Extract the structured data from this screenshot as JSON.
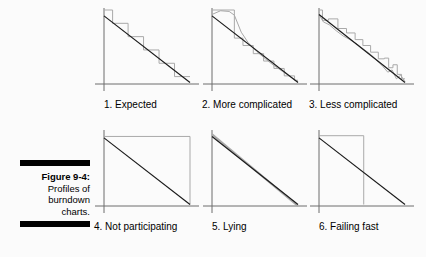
{
  "figure": {
    "caption_title": "Figure 9-4:",
    "caption_lines": [
      "Profiles of",
      "burndown",
      "charts."
    ]
  },
  "colors": {
    "background": "#fbfbfb",
    "axis": "#6d6d6d",
    "ideal_line": "#1a1a1a",
    "actual_line": "#a9a9a9",
    "caption_rule": "#000000",
    "text": "#000000"
  },
  "chart_data": [
    {
      "type": "line",
      "id": "expected",
      "index": "1.",
      "title": "1. Expected",
      "xlabel": "",
      "ylabel": "",
      "xlim": [
        0,
        10
      ],
      "ylim": [
        0,
        10
      ],
      "grid": false,
      "legend": "none",
      "series": [
        {
          "name": "ideal",
          "style": "straight-dark",
          "x": [
            0,
            10
          ],
          "values": [
            9.2,
            0.2
          ]
        },
        {
          "name": "actual",
          "style": "staircase-gray",
          "x": [
            0,
            1,
            1,
            2.8,
            2.8,
            4.6,
            4.6,
            6.4,
            6.4,
            8.2,
            8.2,
            10
          ],
          "values": [
            10,
            10,
            8.2,
            8.2,
            6.4,
            6.4,
            4.6,
            4.6,
            2.8,
            2.8,
            1.0,
            1.0
          ]
        }
      ]
    },
    {
      "type": "line",
      "id": "more-complicated",
      "index": "2.",
      "title": "2. More complicated",
      "xlabel": "",
      "ylabel": "",
      "xlim": [
        0,
        10
      ],
      "ylim": [
        0,
        10
      ],
      "grid": false,
      "legend": "none",
      "series": [
        {
          "name": "ideal",
          "style": "straight-dark",
          "x": [
            0,
            10
          ],
          "values": [
            9.2,
            0.2
          ]
        },
        {
          "name": "actual-staircase",
          "style": "staircase-gray",
          "x": [
            0,
            2.6,
            2.6,
            3.6,
            3.6,
            4.8,
            4.8,
            6.0,
            6.0,
            7.2,
            7.2,
            8.4,
            8.4,
            9.6,
            9.6,
            10
          ],
          "values": [
            10,
            10,
            6.2,
            6.2,
            5.2,
            5.2,
            4.1,
            4.1,
            3.1,
            3.1,
            2.1,
            2.1,
            1.1,
            1.1,
            0.5,
            0.5
          ]
        },
        {
          "name": "actual-smooth",
          "style": "jagged-gray",
          "x": [
            0,
            1.0,
            2.0,
            2.6,
            3.4,
            4.2,
            5.2,
            6.2,
            7.2,
            8.2,
            9.2,
            10
          ],
          "values": [
            9.4,
            9.9,
            9.8,
            9.3,
            7.0,
            5.6,
            4.4,
            3.4,
            2.5,
            1.7,
            0.9,
            0.3
          ]
        }
      ]
    },
    {
      "type": "line",
      "id": "less-complicated",
      "index": "3.",
      "title": "3. Less complicated",
      "xlabel": "",
      "ylabel": "",
      "xlim": [
        0,
        10
      ],
      "ylim": [
        0,
        10
      ],
      "grid": false,
      "legend": "none",
      "series": [
        {
          "name": "ideal",
          "style": "straight-dark",
          "x": [
            0,
            10
          ],
          "values": [
            9.4,
            0.2
          ]
        },
        {
          "name": "actual-staircase",
          "style": "staircase-gray",
          "x": [
            0,
            0.4,
            0.4,
            1.1,
            1.1,
            2.2,
            2.2,
            3.2,
            3.2,
            4.2,
            4.2,
            5.1,
            5.1,
            6.0,
            6.0,
            6.9,
            6.9,
            7.6,
            7.6,
            8.1,
            8.1,
            8.6,
            8.6,
            9.1,
            9.1,
            9.6,
            9.6,
            10
          ],
          "values": [
            10,
            10,
            8.6,
            8.6,
            8.8,
            8.8,
            7.5,
            7.5,
            6.9,
            6.9,
            6.0,
            6.0,
            5.2,
            5.2,
            4.3,
            4.3,
            3.4,
            3.4,
            3.5,
            3.5,
            2.2,
            2.2,
            2.6,
            2.6,
            1.3,
            1.3,
            0.7,
            0.7
          ]
        },
        {
          "name": "actual-smooth",
          "style": "jagged-gray",
          "x": [
            0,
            0.5,
            1.2,
            2.0,
            2.8,
            3.6,
            4.4,
            5.2,
            6.0,
            6.8,
            7.4,
            8.0,
            8.5,
            9.0,
            9.5,
            10
          ],
          "values": [
            9.4,
            8.4,
            8.0,
            7.2,
            6.5,
            6.0,
            5.4,
            4.7,
            4.0,
            3.1,
            2.4,
            1.6,
            1.9,
            0.7,
            1.2,
            0.3
          ]
        }
      ]
    },
    {
      "type": "line",
      "id": "not-participating",
      "index": "4.",
      "title": "4. Not participating",
      "xlabel": "",
      "ylabel": "",
      "xlim": [
        0,
        10
      ],
      "ylim": [
        0,
        10
      ],
      "grid": false,
      "legend": "none",
      "series": [
        {
          "name": "ideal",
          "style": "straight-dark",
          "x": [
            0,
            10
          ],
          "values": [
            9.2,
            0.2
          ]
        },
        {
          "name": "actual",
          "style": "flat-then-drop-gray",
          "x": [
            0,
            10,
            10
          ],
          "values": [
            9.4,
            9.4,
            0.2
          ]
        }
      ]
    },
    {
      "type": "line",
      "id": "lying",
      "index": "5.",
      "title": "5. Lying",
      "xlabel": "",
      "ylabel": "",
      "xlim": [
        0,
        10
      ],
      "ylim": [
        0,
        10
      ],
      "grid": false,
      "legend": "none",
      "series": [
        {
          "name": "ideal",
          "style": "straight-dark",
          "x": [
            0,
            10
          ],
          "values": [
            9.4,
            0.2
          ]
        },
        {
          "name": "actual",
          "style": "straight-gray-overlay",
          "x": [
            0,
            10
          ],
          "values": [
            9.7,
            0.0
          ]
        }
      ]
    },
    {
      "type": "line",
      "id": "failing-fast",
      "index": "6.",
      "title": "6. Failing fast",
      "xlabel": "",
      "ylabel": "",
      "xlim": [
        0,
        10
      ],
      "ylim": [
        0,
        10
      ],
      "grid": false,
      "legend": "none",
      "series": [
        {
          "name": "ideal",
          "style": "straight-dark",
          "x": [
            0,
            10
          ],
          "values": [
            9.2,
            0.2
          ]
        },
        {
          "name": "actual",
          "style": "flat-then-drop-gray",
          "x": [
            0,
            5.2,
            5.2
          ],
          "values": [
            9.5,
            9.5,
            0.2
          ]
        }
      ]
    }
  ]
}
